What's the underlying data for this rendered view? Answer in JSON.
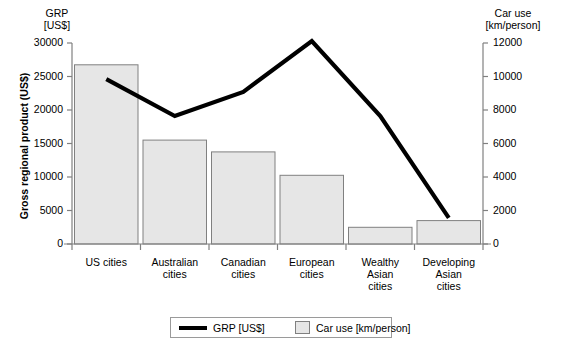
{
  "axes": {
    "left_header_line1": "GRP",
    "left_header_line2": "[US$]",
    "right_header_line1": "Car use",
    "right_header_line2": "[km/person]",
    "y_axis_title": "Gross regional product (US$)"
  },
  "legend": {
    "line_label": "GRP [US$]",
    "bar_label": "Car use [km/person]",
    "line_color": "#000000",
    "bar_fill": "#e6e6e6",
    "bar_stroke": "#808080"
  },
  "chart_data": {
    "type": "bar",
    "title": "",
    "xlabel": "",
    "grid": false,
    "legend_position": "bottom",
    "categories": [
      "US cities",
      "Australian cities",
      "Canadian cities",
      "European cities",
      "Wealthy Asian cities",
      "Developing Asian cities"
    ],
    "category_lines": [
      [
        "US cities"
      ],
      [
        "Australian",
        "cities"
      ],
      [
        "Canadian",
        "cities"
      ],
      [
        "European",
        "cities"
      ],
      [
        "Wealthy",
        "Asian",
        "cities"
      ],
      [
        "Developing",
        "Asian",
        "cities"
      ]
    ],
    "series": [
      {
        "name": "Car use [km/person]",
        "render": "bar",
        "axis": "right",
        "ylabel": "Car use [km/person]",
        "ylim": [
          0,
          12000
        ],
        "ticks": [
          0,
          2000,
          4000,
          6000,
          8000,
          10000,
          12000
        ],
        "tick_labels": [
          "0",
          "2000",
          "4000",
          "6000",
          "8000",
          "10000",
          "12000"
        ],
        "values": [
          10700,
          6200,
          5500,
          4100,
          1000,
          1400
        ]
      },
      {
        "name": "GRP [US$]",
        "render": "line",
        "axis": "left",
        "ylabel": "Gross regional product (US$)",
        "ylim": [
          0,
          30000
        ],
        "ticks": [
          0,
          5000,
          10000,
          15000,
          20000,
          25000,
          30000
        ],
        "tick_labels": [
          "0",
          "5000",
          "10000",
          "15000",
          "20000",
          "25000",
          "30000"
        ],
        "values": [
          24600,
          19100,
          22700,
          30300,
          19100,
          3900
        ]
      }
    ]
  }
}
